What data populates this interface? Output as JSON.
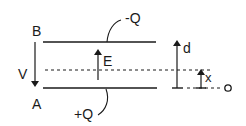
{
  "diagram": {
    "colors": {
      "stroke": "#1a1a1a",
      "background": "#ffffff"
    },
    "labels": {
      "top_plate_point": "B",
      "bottom_plate_point": "A",
      "voltage": "V",
      "field": "E",
      "top_charge": "-Q",
      "bottom_charge": "+Q",
      "separation": "d",
      "position": "x",
      "origin": "o"
    }
  }
}
